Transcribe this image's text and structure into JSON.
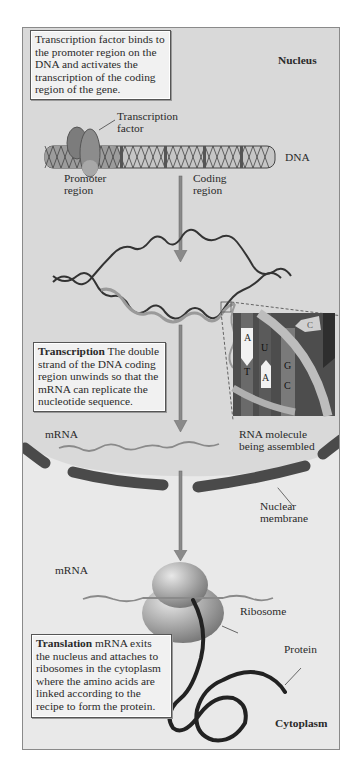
{
  "diagram": {
    "regions": {
      "nucleus": "Nucleus",
      "cytoplasm": "Cytoplasm"
    },
    "boxes": {
      "step1": "Transcription factor binds to the promoter region on the DNA and activates the transcription of the coding region of the gene.",
      "step2_title": "Transcription",
      "step2_body": " The double strand of the DNA coding region unwinds so that the mRNA can replicate the nucleotide sequence.",
      "step3_title": "Translation",
      "step3_body": "  mRNA exits the nucleus and attaches to ribosomes in the cytoplasm where the amino acids are linked according to the recipe to form the protein."
    },
    "labels": {
      "transcription_factor_1": "Transcription",
      "transcription_factor_2": "factor",
      "dna": "DNA",
      "promoter_1": "Promoter",
      "promoter_2": "region",
      "coding_1": "Coding",
      "coding_2": "region",
      "mrna_nucleus": "mRNA",
      "rna_molecule_1": "RNA molecule",
      "rna_molecule_2": "being assembled",
      "nuclear_membrane_1": "Nuclear",
      "nuclear_membrane_2": "membrane",
      "mrna_cytoplasm": "mRNA",
      "ribosome": "Ribosome",
      "protein": "Protein"
    },
    "inset_bases": {
      "dna_top": "A",
      "dna_bottom": "T",
      "rna_top": "U",
      "rna_bottom": "A",
      "pair_top": "G",
      "pair_bottom": "C",
      "free_nucleotide": "C"
    },
    "colors": {
      "nucleus_bg": "#d9d9d9",
      "cytoplasm_bg": "#e9e9e9",
      "membrane": "#4a4a4a",
      "arrow": "#8a8a8a",
      "dna_strand": "#333333",
      "rna_strand": "#9a9a9a"
    }
  }
}
